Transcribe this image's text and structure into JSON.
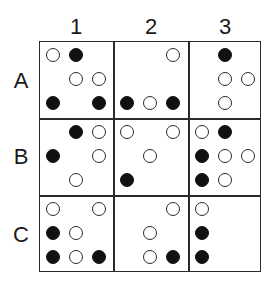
{
  "diagram": {
    "type": "grid-of-dot-patterns",
    "columns": [
      "1",
      "2",
      "3"
    ],
    "rows": [
      "A",
      "B",
      "C"
    ],
    "legend": {
      "open": "open circle",
      "filled": "filled circle"
    },
    "cells": [
      {
        "id": "A1",
        "pattern": [
          [
            "open",
            "filled",
            ""
          ],
          [
            "",
            "open",
            "open"
          ],
          [
            "filled",
            "",
            "filled"
          ]
        ]
      },
      {
        "id": "A2",
        "pattern": [
          [
            "",
            "",
            "open"
          ],
          [
            "",
            "",
            ""
          ],
          [
            "filled",
            "open",
            "filled"
          ]
        ]
      },
      {
        "id": "A3",
        "pattern": [
          [
            "",
            "filled",
            ""
          ],
          [
            "",
            "open",
            "open"
          ],
          [
            "",
            "open",
            ""
          ]
        ]
      },
      {
        "id": "B1",
        "pattern": [
          [
            "",
            "filled",
            "open"
          ],
          [
            "filled",
            "",
            "open"
          ],
          [
            "",
            "open",
            ""
          ]
        ]
      },
      {
        "id": "B2",
        "pattern": [
          [
            "open",
            "",
            "open"
          ],
          [
            "",
            "open",
            ""
          ],
          [
            "filled",
            "",
            ""
          ]
        ]
      },
      {
        "id": "B3",
        "pattern": [
          [
            "open",
            "filled",
            ""
          ],
          [
            "filled",
            "open",
            "open"
          ],
          [
            "filled",
            "open",
            ""
          ]
        ]
      },
      {
        "id": "C1",
        "pattern": [
          [
            "open",
            "",
            "open"
          ],
          [
            "filled",
            "open",
            ""
          ],
          [
            "filled",
            "open",
            "filled"
          ]
        ]
      },
      {
        "id": "C2",
        "pattern": [
          [
            "",
            "",
            "open"
          ],
          [
            "",
            "open",
            ""
          ],
          [
            "",
            "open",
            "filled"
          ]
        ]
      },
      {
        "id": "C3",
        "pattern": [
          [
            "open",
            "",
            ""
          ],
          [
            "filled",
            "",
            ""
          ],
          [
            "filled",
            "",
            ""
          ]
        ]
      }
    ]
  },
  "colors": {
    "line": "#2a2a2a",
    "filled": "#111111",
    "background": "#ffffff"
  }
}
